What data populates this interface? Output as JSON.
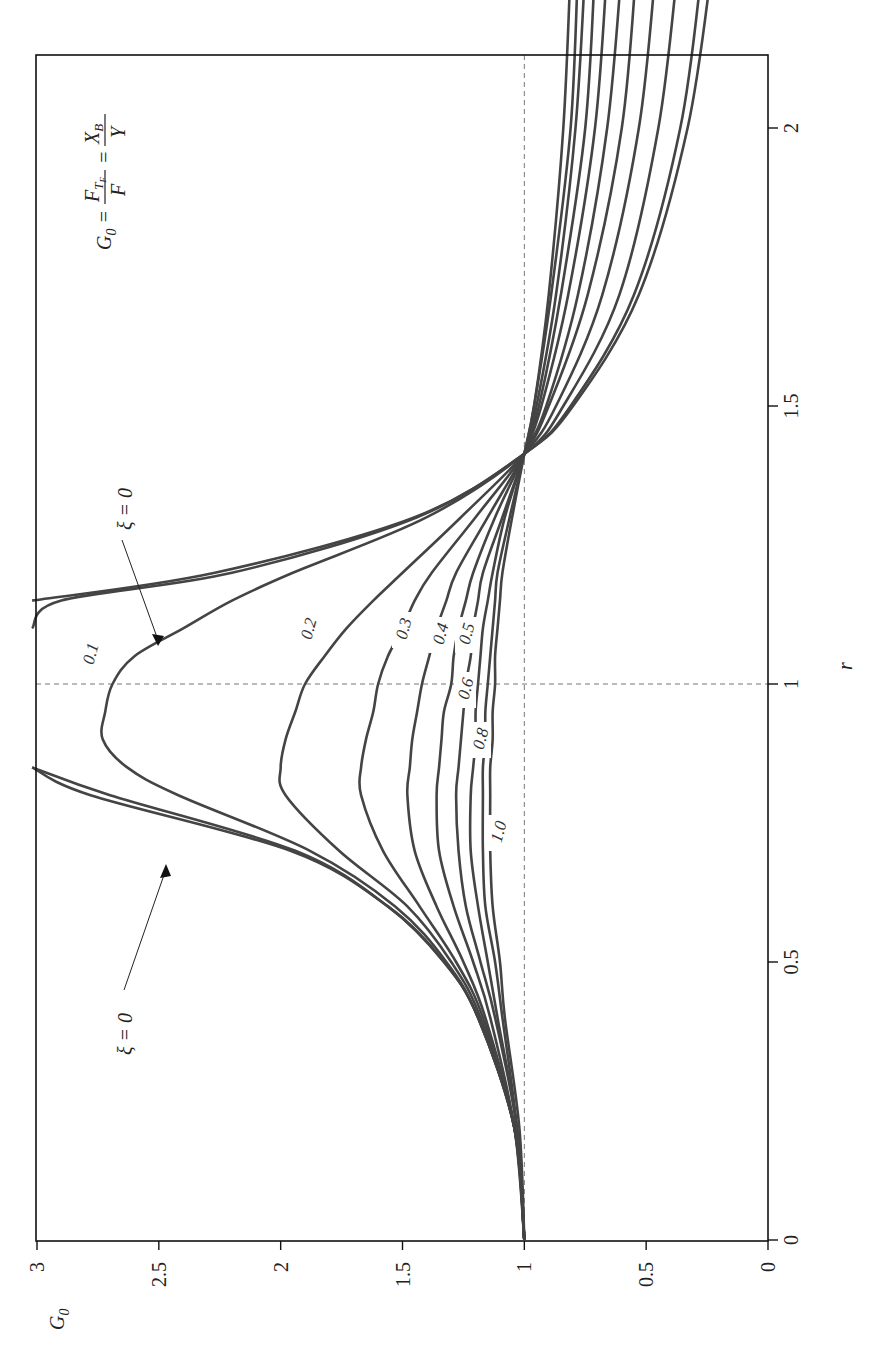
{
  "chart_data": {
    "type": "line",
    "orientation": "rotated-90-ccw",
    "title": "",
    "formula": "G0 = F_TF / F = X_B / Y",
    "xlabel": "r",
    "ylabel": "G0",
    "xlim": [
      0,
      2.3
    ],
    "ylim": [
      0,
      3
    ],
    "x_ticks": [
      "0",
      "0.5",
      "1",
      "1.5",
      "2"
    ],
    "y_ticks": [
      "0",
      "0.5",
      "1",
      "1.5",
      "2",
      "2.5",
      "3"
    ],
    "grid": "dashed reference lines at r=1 and G0=1",
    "annotations": [
      "ξ = 0",
      "ξ = 0"
    ],
    "legend": [],
    "x": [
      0,
      0.2,
      0.4,
      0.5,
      0.6,
      0.7,
      0.8,
      0.85,
      0.9,
      0.95,
      1.0,
      1.05,
      1.1,
      1.15,
      1.2,
      1.3,
      1.414,
      1.5,
      1.7,
      2.0,
      2.3
    ],
    "series": [
      {
        "name": "ξ = 0",
        "label": "",
        "values": [
          1,
          1.04,
          1.19,
          1.33,
          1.56,
          1.96,
          2.78,
          3.6,
          null,
          null,
          null,
          null,
          null,
          3.1,
          2.27,
          1.45,
          1.0,
          0.8,
          0.53,
          0.33,
          0.23
        ]
      },
      {
        "name": "ξ = 0.1",
        "label": "0.1",
        "values": [
          1,
          1.04,
          1.19,
          1.33,
          1.56,
          1.94,
          2.7,
          3.4,
          null,
          null,
          null,
          null,
          3.6,
          2.9,
          2.2,
          1.44,
          1.0,
          0.81,
          0.55,
          0.36,
          0.27
        ]
      },
      {
        "name": "ξ = 0.2",
        "label": "0.2",
        "values": [
          1,
          1.04,
          1.19,
          1.32,
          1.53,
          1.88,
          2.42,
          2.63,
          2.73,
          2.72,
          2.69,
          2.6,
          2.4,
          2.2,
          1.95,
          1.4,
          1.0,
          0.84,
          0.61,
          0.45,
          0.37
        ]
      },
      {
        "name": "ξ = 0.3",
        "label": "0.3",
        "values": [
          1,
          1.04,
          1.18,
          1.3,
          1.48,
          1.76,
          1.98,
          2.0,
          1.98,
          1.94,
          1.9,
          1.82,
          1.73,
          1.62,
          1.5,
          1.26,
          1.0,
          0.87,
          0.68,
          0.53,
          0.46
        ]
      },
      {
        "name": "ξ = 0.4",
        "label": "0.4",
        "values": [
          1,
          1.04,
          1.17,
          1.28,
          1.43,
          1.58,
          1.67,
          1.67,
          1.65,
          1.62,
          1.6,
          1.56,
          1.5,
          1.45,
          1.38,
          1.2,
          1.0,
          0.9,
          0.74,
          0.6,
          0.54
        ]
      },
      {
        "name": "ξ = 0.5",
        "label": "0.5",
        "values": [
          1,
          1.04,
          1.16,
          1.25,
          1.36,
          1.45,
          1.48,
          1.47,
          1.46,
          1.44,
          1.42,
          1.39,
          1.36,
          1.32,
          1.28,
          1.15,
          1.0,
          0.91,
          0.78,
          0.66,
          0.6
        ]
      },
      {
        "name": "ξ = 0.6",
        "label": "0.6",
        "values": [
          1,
          1.04,
          1.14,
          1.21,
          1.29,
          1.35,
          1.36,
          1.35,
          1.34,
          1.33,
          1.3,
          1.29,
          1.27,
          1.24,
          1.21,
          1.12,
          1.0,
          0.93,
          0.82,
          0.71,
          0.66
        ]
      },
      {
        "name": "ξ = 0.7",
        "label": "",
        "values": [
          1,
          1.03,
          1.12,
          1.18,
          1.24,
          1.27,
          1.28,
          1.27,
          1.26,
          1.25,
          1.24,
          1.22,
          1.21,
          1.19,
          1.17,
          1.09,
          1.0,
          0.94,
          0.85,
          0.75,
          0.71
        ]
      },
      {
        "name": "ξ = 0.8",
        "label": "0.8",
        "values": [
          1,
          1.03,
          1.11,
          1.15,
          1.19,
          1.22,
          1.22,
          1.21,
          1.2,
          1.2,
          1.19,
          1.18,
          1.17,
          1.15,
          1.13,
          1.08,
          1.0,
          0.95,
          0.87,
          0.79,
          0.75
        ]
      },
      {
        "name": "ξ = 0.9",
        "label": "",
        "values": [
          1,
          1.03,
          1.09,
          1.12,
          1.16,
          1.17,
          1.17,
          1.17,
          1.16,
          1.16,
          1.15,
          1.14,
          1.13,
          1.12,
          1.11,
          1.06,
          1.0,
          0.96,
          0.89,
          0.81,
          0.78
        ]
      },
      {
        "name": "ξ = 1.0",
        "label": "1.0",
        "values": [
          1,
          1.02,
          1.08,
          1.1,
          1.13,
          1.14,
          1.14,
          1.14,
          1.13,
          1.13,
          1.12,
          1.12,
          1.11,
          1.1,
          1.09,
          1.05,
          1.0,
          0.96,
          0.9,
          0.84,
          0.81
        ]
      }
    ]
  },
  "labels": {
    "formula_lhs": "G",
    "formula_lhs_sub": "0",
    "formula_num1": "F",
    "formula_num1_sub": "T",
    "formula_num1_subsub": "F",
    "formula_den1": "F",
    "formula_num2": "X",
    "formula_num2_sub": "B",
    "formula_den2": "Y",
    "xi_zero_top": "ξ = 0",
    "xi_zero_bottom": "ξ = 0",
    "axis_r": "r",
    "axis_g0": "G",
    "axis_g0_sub": "0"
  }
}
